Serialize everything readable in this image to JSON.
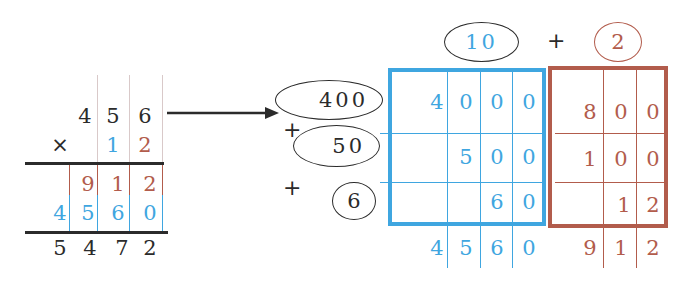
{
  "colors": {
    "ink": "#2b2b2b",
    "tens_blue": "#3fa6e0",
    "ones_red": "#b25c4c",
    "grid_gray": "#d9c9c9"
  },
  "vertical_multiplication": {
    "multiplicand": [
      "4",
      "5",
      "6"
    ],
    "operator": "×",
    "multiplier": [
      "1",
      "2"
    ],
    "partial_product_ones": [
      "9",
      "1",
      "2"
    ],
    "partial_product_tens": [
      "4",
      "5",
      "6",
      "0"
    ],
    "result": [
      "5",
      "4",
      "7",
      "2"
    ]
  },
  "decomposition": {
    "parts": [
      "400",
      "50",
      "6"
    ],
    "plus": "+"
  },
  "multiplier_split": {
    "tens": "10",
    "plus": "+",
    "ones": "2"
  },
  "tens_grid": {
    "rows": [
      [
        "4",
        "0",
        "0",
        "0"
      ],
      [
        "",
        "5",
        "0",
        "0"
      ],
      [
        "",
        "",
        "6",
        "0"
      ]
    ],
    "sum": [
      "4",
      "5",
      "6",
      "0"
    ]
  },
  "ones_grid": {
    "rows": [
      [
        "8",
        "0",
        "0"
      ],
      [
        "1",
        "0",
        "0"
      ],
      [
        "",
        "1",
        "2"
      ]
    ],
    "sum": [
      "9",
      "1",
      "2"
    ]
  }
}
